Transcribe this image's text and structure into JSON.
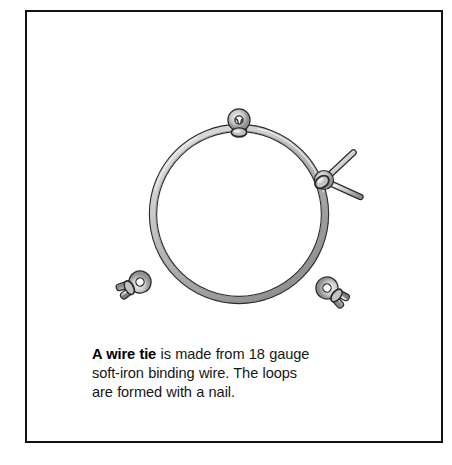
{
  "figure": {
    "caption": {
      "lead": "A wire tie",
      "rest_line1": " is made from 18 gauge",
      "line2": "soft-iron binding wire. The loops",
      "line3": "are formed with a nail.",
      "full_text": "A wire tie is made from 18 gauge soft-iron binding wire. The loops are formed with a nail."
    },
    "colors": {
      "frame_stroke": "#121212",
      "background": "#ffffff",
      "wire_outline": "#2b2b2b",
      "wire_fill_light": "#e8e8e8",
      "wire_fill_mid": "#b9b9b9",
      "wire_fill_shadow": "#8d8d8d",
      "nail_fill": "#d8d8d8",
      "text": "#161616"
    },
    "parts": [
      {
        "name": "wire-ring",
        "shape": "circle",
        "cx": 239,
        "cy": 214,
        "r": 86,
        "wire_thickness": 7
      },
      {
        "name": "loop-top",
        "cx": 239,
        "cy": 120,
        "outer_r": 10,
        "inner_r": 4.6,
        "position": "top"
      },
      {
        "name": "loop-bottom-left",
        "cx": 140,
        "cy": 282,
        "outer_r": 10,
        "inner_r": 4.6,
        "position": "bottom-left"
      },
      {
        "name": "loop-bottom-right",
        "cx": 327,
        "cy": 288,
        "outer_r": 10,
        "inner_r": 4.6,
        "position": "bottom-right"
      },
      {
        "name": "loop-right-with-nail",
        "cx": 324,
        "cy": 180,
        "outer_r": 8,
        "inner_r": 3.6,
        "position": "right"
      },
      {
        "name": "nail",
        "x1": 353,
        "y1": 152,
        "x2": 360,
        "y2": 197,
        "through": "loop-right-with-nail"
      }
    ]
  }
}
